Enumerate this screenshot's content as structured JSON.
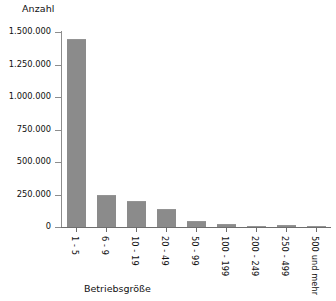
{
  "chart_data": {
    "type": "bar",
    "title": "",
    "subtitle": "",
    "xlabel": "Betriebsgröße",
    "ylabel": "Anzahl",
    "categories": [
      "1 - 5",
      "6 - 9",
      "10 - 19",
      "20 - 49",
      "50 - 99",
      "100 - 199",
      "200 - 249",
      "250 - 499",
      "500 und mehr"
    ],
    "values": [
      1450000,
      250000,
      200000,
      135000,
      50000,
      22000,
      5000,
      12000,
      3000
    ],
    "ylim": [
      0,
      1500000
    ],
    "yticks": [
      0,
      250000,
      500000,
      750000,
      1000000,
      1250000,
      1500000
    ],
    "ytick_labels": [
      "0",
      "250.000",
      "500.000",
      "750.000",
      "1.000.000",
      "1.250.000",
      "1.500.000"
    ],
    "grid": false,
    "legend": false,
    "legend_position": "none",
    "bar_color": "#8b8b8b",
    "axis_color": "#6e6e6e",
    "text_color": "#111111",
    "background": "#ffffff",
    "xtick_rotation": 90
  }
}
